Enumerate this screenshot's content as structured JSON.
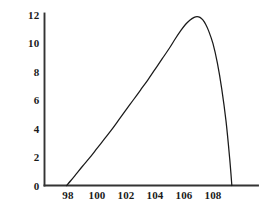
{
  "chart_data": {
    "type": "line",
    "title": "",
    "subtitle": "",
    "xlabel": "",
    "ylabel": "",
    "xlim": [
      96.8,
      110.2
    ],
    "ylim": [
      -0.85,
      12.6
    ],
    "grid": false,
    "legend": null,
    "annotations": [],
    "line_color": "#1a1a1a",
    "axis_color": "#333333",
    "background_color": "#ffffff",
    "xticks": [
      98,
      100,
      102,
      104,
      106,
      108
    ],
    "xtick_labels": [
      "98",
      "100",
      "102",
      "104",
      "106",
      "108"
    ],
    "yticks": [
      0,
      2,
      4,
      6,
      8,
      10,
      12
    ],
    "ytick_labels": [
      "0",
      "2",
      "4",
      "6",
      "8",
      "10",
      "12"
    ],
    "peak": {
      "x": 106.9,
      "y": 11.85
    },
    "series": [
      {
        "name": "curve",
        "x": [
          97.9,
          98.2,
          98.6,
          99.0,
          99.5,
          100.0,
          100.5,
          101.0,
          101.5,
          102.0,
          102.5,
          103.0,
          103.5,
          104.0,
          104.5,
          105.0,
          105.4,
          105.8,
          106.1,
          106.4,
          106.7,
          106.9,
          107.1,
          107.3,
          107.5,
          107.7,
          108.0,
          108.3,
          108.6,
          108.9,
          109.15,
          109.3
        ],
        "y": [
          0.0,
          0.35,
          0.85,
          1.35,
          1.95,
          2.6,
          3.25,
          3.9,
          4.6,
          5.3,
          6.0,
          6.7,
          7.4,
          8.15,
          8.9,
          9.65,
          10.3,
          10.9,
          11.3,
          11.6,
          11.8,
          11.85,
          11.8,
          11.62,
          11.3,
          10.85,
          9.95,
          8.6,
          6.8,
          4.5,
          1.9,
          0.0
        ]
      }
    ]
  },
  "axes": {
    "x_axis_name": "x-axis-line",
    "y_axis_name": "y-axis-line"
  }
}
